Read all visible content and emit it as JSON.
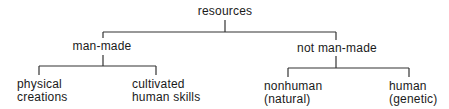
{
  "diagram": {
    "type": "tree",
    "root": {
      "label": "resources",
      "children": [
        {
          "label": "man-made",
          "children": [
            {
              "label_lines": [
                "physical",
                "creations"
              ]
            },
            {
              "label_lines": [
                "cultivated",
                "human skills"
              ]
            }
          ]
        },
        {
          "label": "not man-made",
          "children": [
            {
              "label_lines": [
                "nonhuman",
                "(natural)"
              ]
            },
            {
              "label_lines": [
                "human",
                "(genetic)"
              ]
            }
          ]
        }
      ]
    },
    "line_color": "#333333"
  }
}
